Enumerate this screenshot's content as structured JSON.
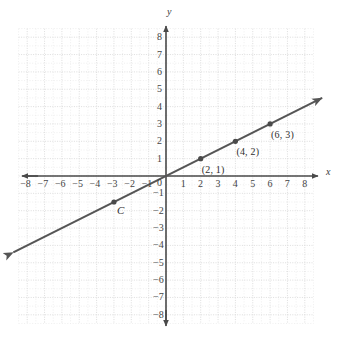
{
  "chart_data": {
    "type": "line",
    "title": "",
    "xlabel": "x",
    "ylabel": "y",
    "xlim": [
      -8,
      8
    ],
    "ylim": [
      -8,
      8
    ],
    "grid": true,
    "minor_grid": true,
    "legend": "none",
    "line": {
      "name": "y = x/2",
      "slope": 0.5,
      "intercept": 0,
      "color": "#555555",
      "arrow_both_ends": true,
      "x_start": -8.8,
      "x_end": 9.0
    },
    "points": [
      {
        "x": 2,
        "y": 1,
        "label": "(2, 1)"
      },
      {
        "x": 4,
        "y": 2,
        "label": "(4, 2)"
      },
      {
        "x": 6,
        "y": 3,
        "label": "(6, 3)"
      },
      {
        "x": -3,
        "y": -1.5,
        "label": "C"
      }
    ],
    "x_ticks": [
      {
        "value": -8,
        "label": "−8"
      },
      {
        "value": -7,
        "label": "−7"
      },
      {
        "value": -6,
        "label": "−6"
      },
      {
        "value": -5,
        "label": "−5"
      },
      {
        "value": -4,
        "label": "−4"
      },
      {
        "value": -3,
        "label": "−3"
      },
      {
        "value": -2,
        "label": "−2"
      },
      {
        "value": -1,
        "label": "−1"
      },
      {
        "value": 1,
        "label": "1"
      },
      {
        "value": 2,
        "label": "2"
      },
      {
        "value": 3,
        "label": "3"
      },
      {
        "value": 4,
        "label": "4"
      },
      {
        "value": 5,
        "label": "5"
      },
      {
        "value": 6,
        "label": "6"
      },
      {
        "value": 7,
        "label": "7"
      },
      {
        "value": 8,
        "label": "8"
      }
    ],
    "y_ticks": [
      {
        "value": 8,
        "label": "8"
      },
      {
        "value": 7,
        "label": "7"
      },
      {
        "value": 6,
        "label": "6"
      },
      {
        "value": 5,
        "label": "5"
      },
      {
        "value": 4,
        "label": "4"
      },
      {
        "value": 3,
        "label": "3"
      },
      {
        "value": 2,
        "label": "2"
      },
      {
        "value": 1,
        "label": "1"
      },
      {
        "value": -1,
        "label": "−1"
      },
      {
        "value": -2,
        "label": "−2"
      },
      {
        "value": -3,
        "label": "−3"
      },
      {
        "value": -4,
        "label": "−4"
      },
      {
        "value": -5,
        "label": "−5"
      },
      {
        "value": -6,
        "label": "−6"
      },
      {
        "value": -7,
        "label": "−7"
      },
      {
        "value": -8,
        "label": "−8"
      }
    ],
    "origin_label": "0",
    "colors": {
      "axis": "#4a4a4a",
      "major_grid": "#d9d9d9",
      "minor_grid": "#e8e8e8",
      "line": "#555555",
      "marker": "#4a4a4a",
      "text": "#3a3a3a",
      "background": "#ffffff"
    }
  },
  "axes": {
    "x_name": "x",
    "y_name": "y"
  }
}
